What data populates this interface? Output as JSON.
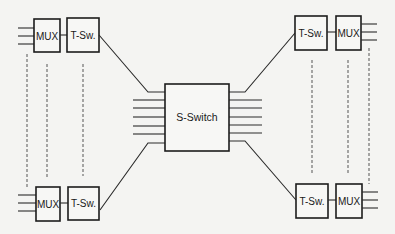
{
  "diagram": {
    "title": "",
    "colors": {
      "background": "#f4f4f2",
      "stroke": "#1c1c1c",
      "dashed": "#555555"
    },
    "center": {
      "label": "S-Switch",
      "x": 165,
      "y": 84,
      "w": 64,
      "h": 67
    },
    "groups": {
      "top_left": {
        "mux_label": "MUX",
        "tsw_label": "T-Sw."
      },
      "bottom_left": {
        "mux_label": "MUX",
        "tsw_label": "T-Sw."
      },
      "top_right": {
        "mux_label": "MUX",
        "tsw_label": "T-Sw."
      },
      "bottom_right": {
        "mux_label": "MUX",
        "tsw_label": "T-Sw."
      }
    },
    "notes": {
      "center_lines_each_side": 7,
      "mux_lines_per_unit": 3,
      "dashed_columns_per_side": 3
    }
  }
}
